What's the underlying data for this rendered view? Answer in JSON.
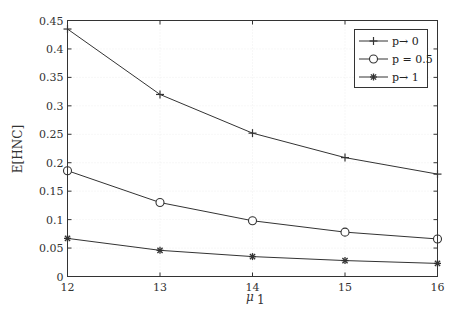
{
  "chart_data": {
    "type": "line",
    "title": "",
    "xlabel": "μ1",
    "xlabel_main": "μ",
    "xlabel_sub": "1",
    "ylabel": "E[HNC]",
    "x": [
      12,
      13,
      14,
      15,
      16
    ],
    "xlim": [
      12,
      16
    ],
    "ylim": [
      0,
      0.45
    ],
    "xticks": [
      "12",
      "13",
      "14",
      "15",
      "16"
    ],
    "yticks": [
      "0",
      "0.05",
      "0.1",
      "0.15",
      "0.2",
      "0.25",
      "0.3",
      "0.35",
      "0.4",
      "0.45"
    ],
    "grid": true,
    "legend_position": "upper right",
    "series": [
      {
        "name": "p→ 0",
        "marker": "plus",
        "values": [
          0.435,
          0.32,
          0.252,
          0.209,
          0.18
        ]
      },
      {
        "name": "p = 0.5",
        "marker": "circle",
        "values": [
          0.186,
          0.13,
          0.098,
          0.078,
          0.066
        ]
      },
      {
        "name": "p→ 1",
        "marker": "star",
        "values": [
          0.067,
          0.046,
          0.035,
          0.028,
          0.023
        ]
      }
    ]
  },
  "colors": {
    "line": "#333333",
    "grid": "#e6e6e6",
    "axis": "#333333",
    "background": "#ffffff"
  }
}
